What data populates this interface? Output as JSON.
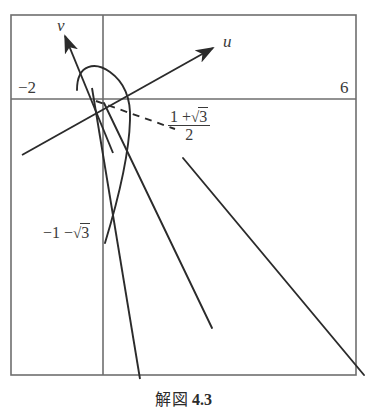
{
  "figure": {
    "caption_text": "解図",
    "caption_number": "4.3",
    "frame": {
      "x": 11,
      "y": 15,
      "width": 345,
      "height": 360,
      "stroke": "#6e6e6e"
    },
    "axes": {
      "horizontal": {
        "y": 99,
        "x1": 11,
        "x2": 356,
        "stroke": "#6e6e6e"
      },
      "vertical": {
        "x": 103,
        "y1": 15,
        "y2": 375,
        "stroke": "#6e6e6e"
      }
    },
    "tick_labels": [
      {
        "name": "left-tick-minus-two",
        "text": "−2",
        "x": 18,
        "y": 78
      },
      {
        "name": "right-tick-six",
        "text": "6",
        "x": 340,
        "y": 78
      }
    ],
    "rotated_axes": [
      {
        "name": "u",
        "label": "u",
        "label_x": 223,
        "label_y": 32,
        "x1": 22,
        "y1": 155,
        "x2": 213,
        "y2": 48,
        "stroke": "#2b2b2b"
      },
      {
        "name": "v",
        "label": "v",
        "label_x": 57,
        "label_y": 16,
        "x1": 113,
        "y1": 153,
        "x2": 65,
        "y2": 36,
        "stroke": "#2b2b2b"
      }
    ],
    "curve_label_fraction": {
      "name": "root-label-one-plus-sqrt-three-over-two",
      "numerator_lead": "1 +",
      "numerator_radical": "3",
      "denominator": "2",
      "x": 168,
      "y": 110
    },
    "curve_label_negative": {
      "name": "root-label-minus-one-minus-sqrt-three",
      "lead": "−1 −",
      "radical": "3",
      "x": 43,
      "y": 229
    },
    "parabola": {
      "name": "parabola-curve",
      "path": "M 77 90 C 77 63, 96 62, 110 72 C 124 82, 131 97, 130 120 C 129 160, 115 210, 105 243",
      "stroke": "#2b2b2b"
    },
    "dashed_line": {
      "name": "dashed-asymptote",
      "x1": 96,
      "y1": 101,
      "x2": 175,
      "y2": 129,
      "stroke": "#2b2b2b",
      "dash": "7 6"
    },
    "solid_lines": [
      {
        "name": "line-steep-left",
        "x1": 92,
        "y1": 88,
        "x2": 140,
        "y2": 379,
        "stroke": "#2b2b2b"
      },
      {
        "name": "line-middle",
        "x1": 104,
        "y1": 103,
        "x2": 212,
        "y2": 328,
        "stroke": "#2b2b2b"
      },
      {
        "name": "line-long-right",
        "x1": 183,
        "y1": 158,
        "x2": 364,
        "y2": 375,
        "stroke": "#2b2b2b"
      }
    ]
  }
}
